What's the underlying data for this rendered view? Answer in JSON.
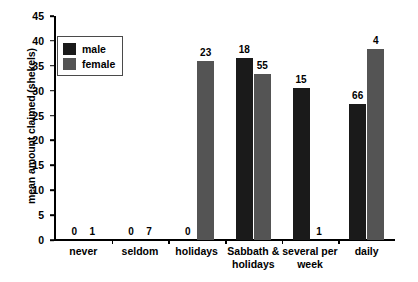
{
  "chart_data": {
    "type": "bar",
    "title": "",
    "xlabel": "",
    "ylabel": "mean amount claimed (shekels)",
    "ylim": [
      0,
      45
    ],
    "ytick_step": 5,
    "yticks": [
      "45",
      "40",
      "35",
      "30",
      "25",
      "20",
      "15",
      "10",
      "5",
      "0"
    ],
    "grid": false,
    "legend_position": "upper-left-inside",
    "categories": [
      "never",
      "seldom",
      "holidays",
      "Sabbath & holidays",
      "several per week",
      "daily"
    ],
    "series": [
      {
        "name": "male",
        "color": "#1a1a1a",
        "values": [
          0,
          0,
          0,
          36.5,
          30.6,
          27.4
        ],
        "point_labels": [
          "0",
          "0",
          "0",
          "18",
          "15",
          "66"
        ]
      },
      {
        "name": "female",
        "color": "#545454",
        "values": [
          0,
          0,
          35.9,
          33.3,
          0,
          38.3
        ],
        "point_labels": [
          "1",
          "7",
          "23",
          "55",
          "1",
          "4"
        ]
      }
    ],
    "annotations": "Numbers above each bar indicate the sample size (n) for that group."
  },
  "legend": {
    "items": [
      {
        "label": "male",
        "color": "#1a1a1a"
      },
      {
        "label": "female",
        "color": "#545454"
      }
    ]
  },
  "axes": {
    "y_title": "mean amount claimed (shekels)"
  }
}
